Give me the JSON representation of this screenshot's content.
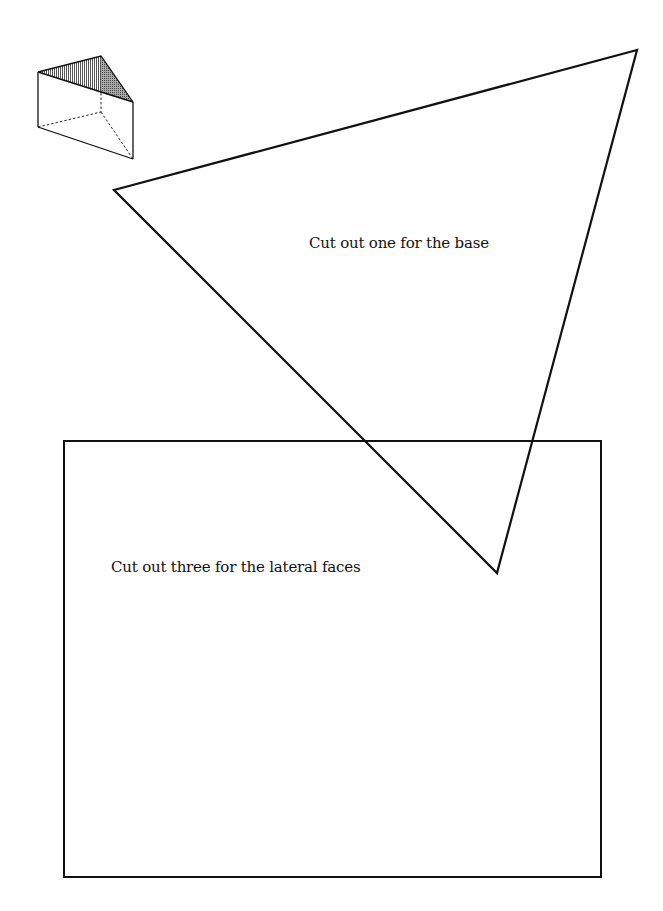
{
  "instructions": {
    "base": "Cut out one for the base",
    "lateral": "Cut out three for the lateral faces"
  },
  "shapes": {
    "prism_icon": {
      "type": "triangular-prism",
      "top_face": [
        [
          38,
          72
        ],
        [
          101,
          56
        ],
        [
          133,
          102
        ]
      ],
      "bottom_face": [
        [
          38,
          127
        ],
        [
          101,
          112
        ],
        [
          133,
          159
        ]
      ]
    },
    "triangle": {
      "vertices": [
        [
          114,
          190
        ],
        [
          637,
          50
        ],
        [
          497,
          573
        ]
      ]
    },
    "rectangle": {
      "x": 64,
      "y": 441,
      "width": 537,
      "height": 436
    }
  },
  "colors": {
    "stroke": "#111111",
    "background": "#fefefe"
  }
}
